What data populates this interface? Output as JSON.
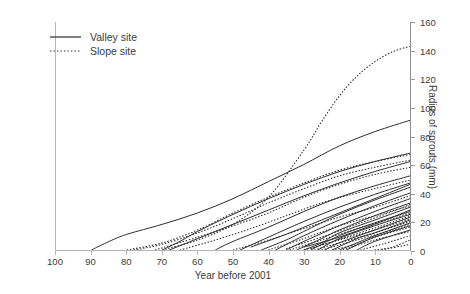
{
  "chart_data": {
    "type": "line",
    "title": "",
    "subtitle": "",
    "xlabel": "Year before 2001",
    "ylabel": "Radius of sprouts (mm)",
    "xlim": [
      100,
      0
    ],
    "ylim": [
      0,
      160
    ],
    "x_reversed": true,
    "xticks": [
      100,
      90,
      80,
      70,
      60,
      50,
      40,
      30,
      20,
      10,
      0
    ],
    "yticks": [
      0,
      20,
      40,
      60,
      80,
      100,
      120,
      140,
      160
    ],
    "grid": false,
    "y_axis_position": "right",
    "legend": {
      "position": "top-left",
      "entries": [
        {
          "label": "Valley site",
          "style": "solid"
        },
        {
          "label": "Slope site",
          "style": "dotted"
        }
      ]
    },
    "series": [
      {
        "name": "Valley 1",
        "style": "solid",
        "points": [
          [
            90,
            0
          ],
          [
            85,
            6
          ],
          [
            80,
            11
          ],
          [
            70,
            18
          ],
          [
            60,
            26
          ],
          [
            50,
            36
          ],
          [
            40,
            48
          ],
          [
            30,
            60
          ],
          [
            20,
            73
          ],
          [
            10,
            83
          ],
          [
            0,
            91
          ]
        ]
      },
      {
        "name": "Valley 2",
        "style": "solid",
        "points": [
          [
            70,
            0
          ],
          [
            65,
            6
          ],
          [
            60,
            13
          ],
          [
            50,
            25
          ],
          [
            40,
            36
          ],
          [
            30,
            46
          ],
          [
            20,
            55
          ],
          [
            10,
            62
          ],
          [
            0,
            68
          ]
        ]
      },
      {
        "name": "Valley 3",
        "style": "solid",
        "points": [
          [
            68,
            0
          ],
          [
            60,
            8
          ],
          [
            50,
            18
          ],
          [
            40,
            28
          ],
          [
            30,
            38
          ],
          [
            20,
            47
          ],
          [
            10,
            55
          ],
          [
            0,
            62
          ]
        ]
      },
      {
        "name": "Valley 4",
        "style": "solid",
        "points": [
          [
            55,
            0
          ],
          [
            50,
            6
          ],
          [
            40,
            16
          ],
          [
            30,
            27
          ],
          [
            20,
            37
          ],
          [
            10,
            45
          ],
          [
            0,
            52
          ]
        ]
      },
      {
        "name": "Valley 5",
        "style": "solid",
        "points": [
          [
            48,
            0
          ],
          [
            40,
            9
          ],
          [
            30,
            20
          ],
          [
            20,
            30
          ],
          [
            10,
            39
          ],
          [
            0,
            47
          ]
        ]
      },
      {
        "name": "Valley 6",
        "style": "solid",
        "points": [
          [
            42,
            0
          ],
          [
            35,
            7
          ],
          [
            30,
            13
          ],
          [
            20,
            25
          ],
          [
            10,
            35
          ],
          [
            0,
            44
          ]
        ]
      },
      {
        "name": "Valley 7",
        "style": "solid",
        "points": [
          [
            38,
            0
          ],
          [
            30,
            10
          ],
          [
            20,
            21
          ],
          [
            10,
            31
          ],
          [
            0,
            40
          ]
        ]
      },
      {
        "name": "Valley 8",
        "style": "solid",
        "points": [
          [
            35,
            0
          ],
          [
            30,
            6
          ],
          [
            20,
            17
          ],
          [
            10,
            27
          ],
          [
            0,
            36
          ]
        ]
      },
      {
        "name": "Valley 9",
        "style": "solid",
        "points": [
          [
            32,
            0
          ],
          [
            25,
            8
          ],
          [
            20,
            14
          ],
          [
            10,
            24
          ],
          [
            0,
            33
          ]
        ]
      },
      {
        "name": "Valley 10",
        "style": "solid",
        "points": [
          [
            30,
            0
          ],
          [
            25,
            5
          ],
          [
            20,
            12
          ],
          [
            10,
            21
          ],
          [
            0,
            30
          ]
        ]
      },
      {
        "name": "Valley 11",
        "style": "solid",
        "points": [
          [
            28,
            0
          ],
          [
            20,
            10
          ],
          [
            10,
            19
          ],
          [
            0,
            27
          ]
        ]
      },
      {
        "name": "Valley 12",
        "style": "solid",
        "points": [
          [
            26,
            0
          ],
          [
            20,
            8
          ],
          [
            10,
            17
          ],
          [
            0,
            25
          ]
        ]
      },
      {
        "name": "Valley 13",
        "style": "solid",
        "points": [
          [
            24,
            0
          ],
          [
            20,
            5
          ],
          [
            10,
            14
          ],
          [
            0,
            23
          ]
        ]
      },
      {
        "name": "Valley 14",
        "style": "solid",
        "points": [
          [
            22,
            0
          ],
          [
            15,
            8
          ],
          [
            10,
            12
          ],
          [
            0,
            21
          ]
        ]
      },
      {
        "name": "Valley 15",
        "style": "solid",
        "points": [
          [
            20,
            0
          ],
          [
            15,
            5
          ],
          [
            10,
            10
          ],
          [
            0,
            19
          ]
        ]
      },
      {
        "name": "Valley 16",
        "style": "solid",
        "points": [
          [
            18,
            0
          ],
          [
            10,
            9
          ],
          [
            0,
            17
          ]
        ]
      },
      {
        "name": "Valley 17",
        "style": "solid",
        "points": [
          [
            15,
            0
          ],
          [
            10,
            6
          ],
          [
            0,
            14
          ]
        ]
      },
      {
        "name": "Valley 18",
        "style": "solid",
        "points": [
          [
            30,
            2
          ],
          [
            20,
            9
          ],
          [
            10,
            18
          ],
          [
            0,
            28
          ]
        ]
      },
      {
        "name": "Valley 19",
        "style": "solid",
        "points": [
          [
            45,
            2
          ],
          [
            35,
            11
          ],
          [
            25,
            21
          ],
          [
            15,
            31
          ],
          [
            0,
            46
          ]
        ]
      },
      {
        "name": "Slope 1",
        "style": "dotted",
        "points": [
          [
            70,
            0
          ],
          [
            60,
            7
          ],
          [
            50,
            18
          ],
          [
            40,
            37
          ],
          [
            30,
            70
          ],
          [
            25,
            90
          ],
          [
            20,
            108
          ],
          [
            15,
            122
          ],
          [
            10,
            132
          ],
          [
            5,
            139
          ],
          [
            0,
            143
          ]
        ]
      },
      {
        "name": "Slope 2",
        "style": "dotted",
        "points": [
          [
            80,
            0
          ],
          [
            70,
            5
          ],
          [
            60,
            14
          ],
          [
            50,
            26
          ],
          [
            40,
            37
          ],
          [
            30,
            47
          ],
          [
            20,
            56
          ],
          [
            10,
            62
          ],
          [
            0,
            67
          ]
        ]
      },
      {
        "name": "Slope 3",
        "style": "dotted",
        "points": [
          [
            78,
            0
          ],
          [
            70,
            4
          ],
          [
            60,
            12
          ],
          [
            50,
            22
          ],
          [
            40,
            33
          ],
          [
            30,
            43
          ],
          [
            20,
            52
          ],
          [
            10,
            58
          ],
          [
            0,
            63
          ]
        ]
      },
      {
        "name": "Slope 4",
        "style": "dotted",
        "points": [
          [
            72,
            0
          ],
          [
            60,
            9
          ],
          [
            50,
            17
          ],
          [
            40,
            26
          ],
          [
            30,
            37
          ],
          [
            20,
            46
          ],
          [
            10,
            53
          ],
          [
            0,
            58
          ]
        ]
      },
      {
        "name": "Slope 5",
        "style": "dotted",
        "points": [
          [
            65,
            0
          ],
          [
            55,
            7
          ],
          [
            45,
            15
          ],
          [
            35,
            24
          ],
          [
            25,
            33
          ],
          [
            15,
            40
          ],
          [
            0,
            49
          ]
        ]
      },
      {
        "name": "Slope 6",
        "style": "dotted",
        "points": [
          [
            50,
            0
          ],
          [
            40,
            7
          ],
          [
            30,
            15
          ],
          [
            20,
            23
          ],
          [
            10,
            30
          ],
          [
            0,
            38
          ]
        ]
      },
      {
        "name": "Slope 7",
        "style": "dotted",
        "points": [
          [
            40,
            0
          ],
          [
            30,
            8
          ],
          [
            20,
            17
          ],
          [
            10,
            24
          ],
          [
            0,
            31
          ]
        ]
      },
      {
        "name": "Slope 8",
        "style": "dotted",
        "points": [
          [
            34,
            0
          ],
          [
            25,
            7
          ],
          [
            15,
            15
          ],
          [
            5,
            22
          ],
          [
            0,
            26
          ]
        ]
      },
      {
        "name": "Slope 9",
        "style": "dotted",
        "points": [
          [
            30,
            0
          ],
          [
            20,
            7
          ],
          [
            10,
            14
          ],
          [
            0,
            22
          ]
        ]
      },
      {
        "name": "Slope 10",
        "style": "dotted",
        "points": [
          [
            27,
            0
          ],
          [
            20,
            5
          ],
          [
            10,
            12
          ],
          [
            0,
            20
          ]
        ]
      },
      {
        "name": "Slope 11",
        "style": "dotted",
        "points": [
          [
            25,
            0
          ],
          [
            15,
            7
          ],
          [
            5,
            14
          ],
          [
            0,
            18
          ]
        ]
      },
      {
        "name": "Slope 12",
        "style": "dotted",
        "points": [
          [
            22,
            0
          ],
          [
            15,
            4
          ],
          [
            10,
            9
          ],
          [
            0,
            16
          ]
        ]
      },
      {
        "name": "Slope 13",
        "style": "dotted",
        "points": [
          [
            19,
            0
          ],
          [
            10,
            7
          ],
          [
            0,
            13
          ]
        ]
      },
      {
        "name": "Slope 14",
        "style": "dotted",
        "points": [
          [
            14,
            0
          ],
          [
            8,
            4
          ],
          [
            0,
            10
          ]
        ]
      },
      {
        "name": "Slope 15",
        "style": "dotted",
        "points": [
          [
            10,
            0
          ],
          [
            5,
            2
          ],
          [
            0,
            7
          ]
        ]
      },
      {
        "name": "Slope 16",
        "style": "dotted",
        "points": [
          [
            8,
            0
          ],
          [
            0,
            4
          ]
        ]
      },
      {
        "name": "Slope 17",
        "style": "dotted",
        "points": [
          [
            35,
            1
          ],
          [
            25,
            9
          ],
          [
            15,
            18
          ],
          [
            5,
            27
          ],
          [
            0,
            32
          ]
        ]
      },
      {
        "name": "Slope 18",
        "style": "dotted",
        "points": [
          [
            28,
            1
          ],
          [
            18,
            9
          ],
          [
            8,
            17
          ],
          [
            0,
            24
          ]
        ]
      }
    ],
    "colors": {
      "line": "#2b2b2b",
      "axis": "#b7b7b7",
      "text": "#3b3b3b",
      "background": "#ffffff"
    }
  }
}
